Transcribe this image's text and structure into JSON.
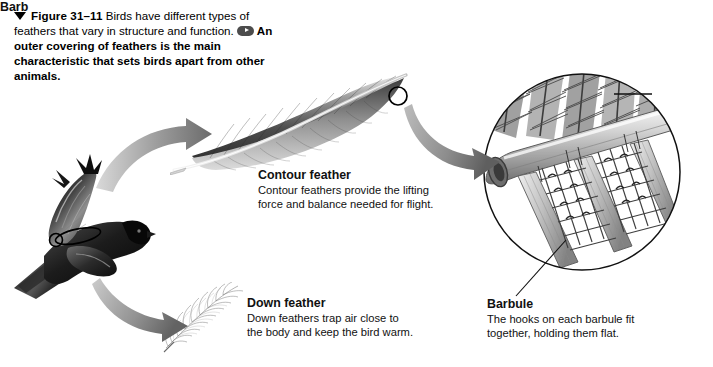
{
  "figure": {
    "marker_icon": "down-triangle-icon",
    "number": "Figure 31–11",
    "caption_part1": "Birds have different types of feathers that vary in structure and function.",
    "key_question_icon": "key-question-icon",
    "caption_part2": "An outer covering of feathers is the main characteristic that sets birds apart from other animals.",
    "caption_lines": [
      "Birds have",
      "different types of feathers that vary",
      "in structure and function.",
      "An",
      "outer covering of feathers is the",
      "main characteristic that sets birds",
      "apart from other animals."
    ]
  },
  "labels": {
    "contour": {
      "title": "Contour feather",
      "body_lines": [
        "Contour feathers provide the lifting",
        "force and balance needed for flight."
      ]
    },
    "down": {
      "title": "Down feather",
      "body_lines": [
        "Down feathers trap air close to",
        "the body and keep the bird warm."
      ]
    },
    "barbule": {
      "title": "Barbule",
      "body_lines": [
        "The hooks on each barbule fit",
        "together, holding them flat."
      ]
    },
    "barb": {
      "title": "Barb"
    }
  },
  "illustrations": {
    "bird": "flying-bird-illustration",
    "contour_feather": "contour-feather-illustration",
    "down_feather": "down-feather-illustration",
    "micrograph": "barb-barbule-magnified-illustration",
    "arrow_bird_to_contour": "curved-arrow-icon",
    "arrow_bird_to_down": "curved-arrow-icon",
    "arrow_contour_to_micro": "curved-arrow-icon",
    "callout_circle_bird": "callout-oval-icon",
    "callout_circle_feather": "callout-circle-icon",
    "leader_barb": "leader-line",
    "leader_barbule": "leader-line"
  },
  "colors": {
    "background": "#ffffff",
    "text": "#111111",
    "arrow_gray": "#8a8a8a",
    "ink": "#3a3a3a"
  }
}
